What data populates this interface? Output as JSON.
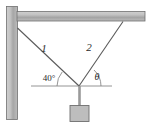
{
  "figure": {
    "background_color": "#ffffff"
  },
  "structure": {
    "wall": {
      "name": "vertical wall",
      "fill_light": "#c9c9c9",
      "fill_dark": "#9a9a9a",
      "stroke": "#6f6f6f"
    },
    "beam": {
      "name": "horizontal beam",
      "fill_light": "#c9c9c9",
      "fill_dark": "#9a9a9a",
      "stroke": "#6f6f6f"
    },
    "block": {
      "name": "suspended block",
      "fill": "#bdbdbd",
      "stroke": "#6f6f6f"
    }
  },
  "cables": [
    {
      "label": "1",
      "from": "wall",
      "to": "junction",
      "angle_label": "40°",
      "color": "#5a5a5a"
    },
    {
      "label": "2",
      "from": "beam",
      "to": "junction",
      "angle_label": "θ",
      "color": "#5a5a5a"
    }
  ],
  "angles": {
    "left": "40°",
    "right": "θ"
  },
  "reference_line": {
    "name": "horizontal reference line",
    "color": "#7a7a7a"
  },
  "hanging_rod": {
    "name": "vertical hanging rod",
    "color": "#9a9a9a"
  }
}
